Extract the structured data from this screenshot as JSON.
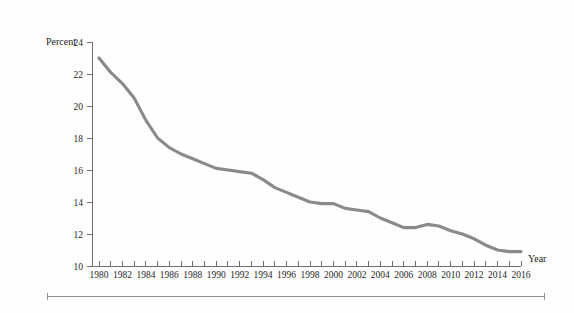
{
  "chart_data": {
    "type": "line",
    "title": "",
    "xlabel": "Year",
    "ylabel": "Percent",
    "x": [
      1980,
      1981,
      1982,
      1983,
      1984,
      1985,
      1986,
      1987,
      1988,
      1989,
      1990,
      1991,
      1992,
      1993,
      1994,
      1995,
      1996,
      1997,
      1998,
      1999,
      2000,
      2001,
      2002,
      2003,
      2004,
      2005,
      2006,
      2007,
      2008,
      2009,
      2010,
      2011,
      2012,
      2013,
      2014,
      2015,
      2016
    ],
    "values": [
      23.0,
      22.1,
      21.4,
      20.5,
      19.1,
      18.0,
      17.4,
      17.0,
      16.7,
      16.4,
      16.1,
      16.0,
      15.9,
      15.8,
      15.4,
      14.9,
      14.6,
      14.3,
      14.0,
      13.9,
      13.9,
      13.6,
      13.5,
      13.4,
      13.0,
      12.7,
      12.4,
      12.4,
      12.6,
      12.5,
      12.2,
      12.0,
      11.7,
      11.3,
      11.0,
      10.9,
      10.9
    ],
    "series": [
      {
        "name": "Percent",
        "color": "#8a8a8a",
        "values": [
          23.0,
          22.1,
          21.4,
          20.5,
          19.1,
          18.0,
          17.4,
          17.0,
          16.7,
          16.4,
          16.1,
          16.0,
          15.9,
          15.8,
          15.4,
          14.9,
          14.6,
          14.3,
          14.0,
          13.9,
          13.9,
          13.6,
          13.5,
          13.4,
          13.0,
          12.7,
          12.4,
          12.4,
          12.6,
          12.5,
          12.2,
          12.0,
          11.7,
          11.3,
          11.0,
          10.9,
          10.9
        ]
      }
    ],
    "xlim": [
      1980,
      2016
    ],
    "ylim": [
      10,
      24
    ],
    "x_tick_labels": [
      "1980",
      "1982",
      "1984",
      "1986",
      "1988",
      "1990",
      "1992",
      "1994",
      "1996",
      "1998",
      "2000",
      "2002",
      "2004",
      "2006",
      "2008",
      "2010",
      "2012",
      "2014",
      "2016"
    ],
    "x_tick_label_values": [
      1980,
      1982,
      1984,
      1986,
      1988,
      1990,
      1992,
      1994,
      1996,
      1998,
      2000,
      2002,
      2004,
      2006,
      2008,
      2010,
      2012,
      2014,
      2016
    ],
    "x_minor_tick_values": [
      1980,
      1981,
      1982,
      1983,
      1984,
      1985,
      1986,
      1987,
      1988,
      1989,
      1990,
      1991,
      1992,
      1993,
      1994,
      1995,
      1996,
      1997,
      1998,
      1999,
      2000,
      2001,
      2002,
      2003,
      2004,
      2005,
      2006,
      2007,
      2008,
      2009,
      2010,
      2011,
      2012,
      2013,
      2014,
      2015,
      2016
    ],
    "y_tick_labels": [
      "24",
      "22",
      "20",
      "18",
      "16",
      "14",
      "12",
      "10"
    ],
    "y_tick_values": [
      24,
      22,
      20,
      18,
      16,
      14,
      12,
      10
    ],
    "grid": false,
    "legend": "none",
    "axis_color": "#6f6f6f",
    "line_color": "#8a8a8a",
    "background": "#fefefe"
  },
  "labels": {
    "y_axis_title": "Percent",
    "x_axis_title": "Year"
  }
}
